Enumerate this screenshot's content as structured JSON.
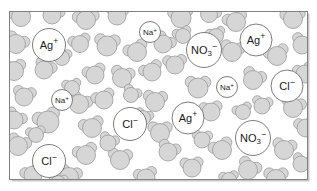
{
  "figure": {
    "name": "aqueous-ionic-solution",
    "frame": {
      "x": 9.5,
      "y": 11.5,
      "width": 298,
      "height": 168,
      "stroke": "#808080",
      "stroke_width": 1,
      "fill": "#ffffff"
    },
    "shadow": {
      "color": "#c8c8c8",
      "offset_x": 2,
      "offset_y": 2
    }
  },
  "style": {
    "water_fill": "#d6d6d6",
    "water_stroke": "#9a9a9a",
    "water_stroke_width": 0.8,
    "ion_fill": "#ffffff",
    "ion_stroke": "#6e6e6e",
    "ion_stroke_width": 0.9,
    "ion_text_color": "#1a1a1a",
    "background": "#ffffff"
  },
  "chart_data": {
    "type": "scatter",
    "xlabel": "",
    "ylabel": "",
    "legend_position": "none",
    "grid": false,
    "species_counts": [
      {
        "label": "H2O",
        "count": 62
      },
      {
        "label": "Ag+",
        "count": 3
      },
      {
        "label": "Cl-",
        "count": 3
      },
      {
        "label": "Na+",
        "count": 2
      },
      {
        "label": "NO3-",
        "count": 2
      }
    ]
  },
  "ions": [
    {
      "id": "ag-1",
      "species": "Ag",
      "base": "Ag",
      "sub": "",
      "charge": "+",
      "cx": 49,
      "cy": 45,
      "r": 16.5,
      "font": 11
    },
    {
      "id": "na-1",
      "species": "Na",
      "base": "Na",
      "sub": "",
      "charge": "+",
      "cx": 150,
      "cy": 32,
      "r": 10.5,
      "font": 8
    },
    {
      "id": "no3-1",
      "species": "NO3",
      "base": "NO",
      "sub": "3",
      "charge": "−",
      "cx": 204,
      "cy": 50,
      "r": 17.5,
      "font": 11
    },
    {
      "id": "ag-2",
      "species": "Ag",
      "base": "Ag",
      "sub": "",
      "charge": "+",
      "cx": 256,
      "cy": 40,
      "r": 16.0,
      "font": 11
    },
    {
      "id": "na-2",
      "species": "Na",
      "base": "Na",
      "sub": "",
      "charge": "+",
      "cx": 62,
      "cy": 100,
      "r": 10.5,
      "font": 8
    },
    {
      "id": "na-3",
      "species": "Na",
      "base": "Na",
      "sub": "",
      "charge": "+",
      "cx": 227,
      "cy": 87,
      "r": 10.5,
      "font": 8
    },
    {
      "id": "cl-1",
      "species": "Cl",
      "base": "Cl",
      "sub": "",
      "charge": "−",
      "cx": 287,
      "cy": 86,
      "r": 16.0,
      "font": 11
    },
    {
      "id": "cl-2",
      "species": "Cl",
      "base": "Cl",
      "sub": "",
      "charge": "−",
      "cx": 130,
      "cy": 124,
      "r": 16.5,
      "font": 11
    },
    {
      "id": "ag-3",
      "species": "Ag",
      "base": "Ag",
      "sub": "",
      "charge": "+",
      "cx": 188,
      "cy": 118,
      "r": 16.0,
      "font": 11
    },
    {
      "id": "no3-2",
      "species": "NO3",
      "base": "NO",
      "sub": "3",
      "charge": "−",
      "cx": 253,
      "cy": 138,
      "r": 17.5,
      "font": 11
    },
    {
      "id": "cl-3",
      "species": "Cl",
      "base": "Cl",
      "sub": "",
      "charge": "−",
      "cx": 49,
      "cy": 161,
      "r": 16.5,
      "font": 11
    }
  ],
  "water_molecules": [
    {
      "ox": 21,
      "oy": 17,
      "r": 9.5,
      "a1": 205,
      "a2": 300
    },
    {
      "ox": 52,
      "oy": 15,
      "r": 9.0,
      "a1": 250,
      "a2": 340
    },
    {
      "ox": 86,
      "oy": 20,
      "r": 9.5,
      "a1": 200,
      "a2": 330
    },
    {
      "ox": 117,
      "oy": 16,
      "r": 9.0,
      "a1": 230,
      "a2": 320
    },
    {
      "ox": 181,
      "oy": 18,
      "r": 10.0,
      "a1": 215,
      "a2": 310
    },
    {
      "ox": 209,
      "oy": 14,
      "r": 8.5,
      "a1": 250,
      "a2": 350
    },
    {
      "ox": 236,
      "oy": 22,
      "r": 9.5,
      "a1": 195,
      "a2": 305
    },
    {
      "ox": 293,
      "oy": 19,
      "r": 9.5,
      "a1": 210,
      "a2": 320
    },
    {
      "ox": 16,
      "oy": 44,
      "r": 9.5,
      "a1": 240,
      "a2": 345
    },
    {
      "ox": 80,
      "oy": 44,
      "r": 8.5,
      "a1": 200,
      "a2": 310
    },
    {
      "ox": 107,
      "oy": 46,
      "r": 10.0,
      "a1": 225,
      "a2": 325
    },
    {
      "ox": 137,
      "oy": 52,
      "r": 9.5,
      "a1": 190,
      "a2": 300
    },
    {
      "ox": 163,
      "oy": 44,
      "r": 9.0,
      "a1": 255,
      "a2": 350
    },
    {
      "ox": 175,
      "oy": 65,
      "r": 9.0,
      "a1": 210,
      "a2": 320
    },
    {
      "ox": 232,
      "oy": 52,
      "r": 9.5,
      "a1": 230,
      "a2": 335
    },
    {
      "ox": 277,
      "oy": 56,
      "r": 9.5,
      "a1": 200,
      "a2": 310
    },
    {
      "ox": 302,
      "oy": 45,
      "r": 9.0,
      "a1": 240,
      "a2": 340
    },
    {
      "ox": 14,
      "oy": 71,
      "r": 9.5,
      "a1": 215,
      "a2": 315
    },
    {
      "ox": 44,
      "oy": 70,
      "r": 9.0,
      "a1": 250,
      "a2": 345
    },
    {
      "ox": 95,
      "oy": 75,
      "r": 9.0,
      "a1": 200,
      "a2": 305
    },
    {
      "ox": 122,
      "oy": 78,
      "r": 9.5,
      "a1": 235,
      "a2": 330
    },
    {
      "ox": 152,
      "oy": 72,
      "r": 9.0,
      "a1": 190,
      "a2": 300
    },
    {
      "ox": 198,
      "oy": 88,
      "r": 10.0,
      "a1": 220,
      "a2": 320
    },
    {
      "ox": 253,
      "oy": 80,
      "r": 9.5,
      "a1": 245,
      "a2": 340
    },
    {
      "ox": 305,
      "oy": 74,
      "r": 9.0,
      "a1": 205,
      "a2": 300
    },
    {
      "ox": 24,
      "oy": 97,
      "r": 9.0,
      "a1": 230,
      "a2": 330
    },
    {
      "ox": 48,
      "oy": 122,
      "r": 11.0,
      "a1": 200,
      "a2": 300
    },
    {
      "ox": 79,
      "oy": 104,
      "r": 9.5,
      "a1": 245,
      "a2": 345
    },
    {
      "ox": 104,
      "oy": 100,
      "r": 9.0,
      "a1": 195,
      "a2": 305
    },
    {
      "ox": 155,
      "oy": 102,
      "r": 9.5,
      "a1": 225,
      "a2": 325
    },
    {
      "ox": 211,
      "oy": 112,
      "r": 9.0,
      "a1": 210,
      "a2": 315
    },
    {
      "ox": 293,
      "oy": 108,
      "r": 9.5,
      "a1": 235,
      "a2": 335
    },
    {
      "ox": 14,
      "oy": 120,
      "r": 9.0,
      "a1": 250,
      "a2": 350
    },
    {
      "ox": 92,
      "oy": 128,
      "r": 9.5,
      "a1": 200,
      "a2": 310
    },
    {
      "ox": 160,
      "oy": 133,
      "r": 9.5,
      "a1": 220,
      "a2": 320
    },
    {
      "ox": 168,
      "oy": 152,
      "r": 9.0,
      "a1": 245,
      "a2": 340
    },
    {
      "ox": 222,
      "oy": 150,
      "r": 9.5,
      "a1": 195,
      "a2": 300
    },
    {
      "ox": 284,
      "oy": 150,
      "r": 9.5,
      "a1": 230,
      "a2": 330
    },
    {
      "ox": 306,
      "oy": 128,
      "r": 9.0,
      "a1": 210,
      "a2": 310
    },
    {
      "ox": 18,
      "oy": 146,
      "r": 9.5,
      "a1": 240,
      "a2": 340
    },
    {
      "ox": 86,
      "oy": 155,
      "r": 9.5,
      "a1": 200,
      "a2": 305
    },
    {
      "ox": 120,
      "oy": 160,
      "r": 9.5,
      "a1": 225,
      "a2": 325
    },
    {
      "ox": 192,
      "oy": 168,
      "r": 9.0,
      "a1": 215,
      "a2": 315
    },
    {
      "ox": 248,
      "oy": 170,
      "r": 9.5,
      "a1": 250,
      "a2": 345
    },
    {
      "ox": 33,
      "oy": 175,
      "r": 9.0,
      "a1": 195,
      "a2": 300
    },
    {
      "ox": 69,
      "oy": 177,
      "r": 9.5,
      "a1": 235,
      "a2": 335
    },
    {
      "ox": 146,
      "oy": 178,
      "r": 9.0,
      "a1": 205,
      "a2": 310
    },
    {
      "ox": 276,
      "oy": 179,
      "r": 9.5,
      "a1": 220,
      "a2": 320
    },
    {
      "ox": 62,
      "oy": 58,
      "r": 7.5,
      "a1": 215,
      "a2": 325
    },
    {
      "ox": 131,
      "oy": 95,
      "r": 7.5,
      "a1": 250,
      "a2": 345
    },
    {
      "ox": 183,
      "oy": 36,
      "r": 7.5,
      "a1": 200,
      "a2": 300
    },
    {
      "ox": 262,
      "oy": 106,
      "r": 8.0,
      "a1": 230,
      "a2": 330
    },
    {
      "ox": 36,
      "oy": 135,
      "r": 7.5,
      "a1": 205,
      "a2": 315
    },
    {
      "ox": 108,
      "oy": 143,
      "r": 8.0,
      "a1": 245,
      "a2": 340
    },
    {
      "ox": 243,
      "oy": 112,
      "r": 7.5,
      "a1": 195,
      "a2": 305
    },
    {
      "ox": 202,
      "oy": 140,
      "r": 8.0,
      "a1": 225,
      "a2": 325
    },
    {
      "ox": 72,
      "oy": 88,
      "r": 7.5,
      "a1": 210,
      "a2": 310
    },
    {
      "ox": 143,
      "oy": 118,
      "r": 7.5,
      "a1": 240,
      "a2": 340
    },
    {
      "ox": 216,
      "oy": 36,
      "r": 7.5,
      "a1": 200,
      "a2": 310
    },
    {
      "ox": 58,
      "oy": 183,
      "r": 7.5,
      "a1": 230,
      "a2": 330
    },
    {
      "ox": 229,
      "oy": 180,
      "r": 7.5,
      "a1": 210,
      "a2": 315
    },
    {
      "ox": 301,
      "oy": 164,
      "r": 8.0,
      "a1": 245,
      "a2": 345
    }
  ]
}
